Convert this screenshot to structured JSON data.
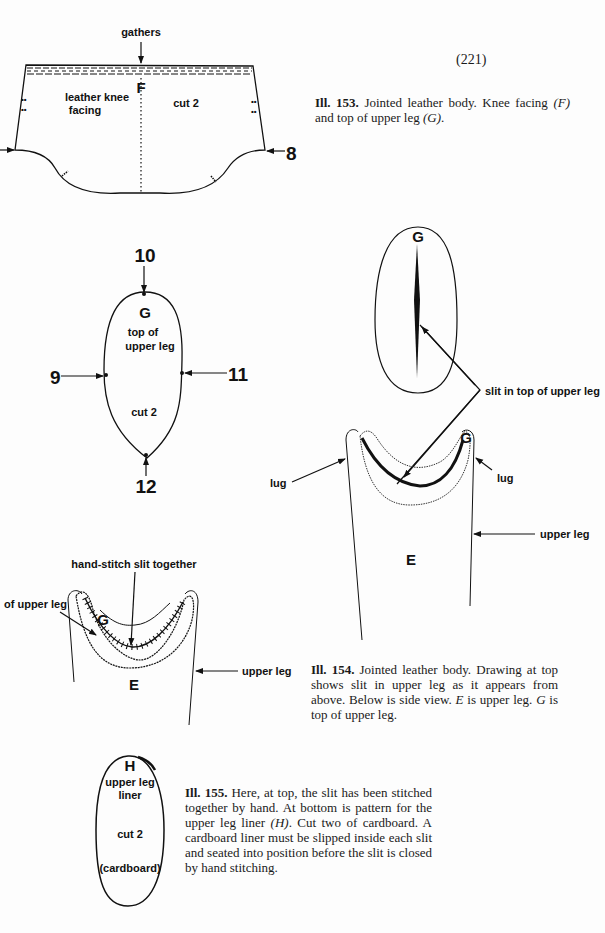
{
  "page_number": "(221)",
  "figures": {
    "ill153": {
      "labels": {
        "gathers": "gathers",
        "piece_letter": "F",
        "piece_name_line1": "leather knee",
        "piece_name_line2": "facing",
        "cut": "cut 2",
        "marker_right": "8"
      },
      "caption": {
        "number": "Ill. 153.",
        "text": " Jointed leather body. Knee facing ",
        "ref1": "(F)",
        "text2": " and top of upper leg ",
        "ref2": "(G)",
        "text3": "."
      }
    },
    "pattern_g": {
      "letter": "G",
      "name_line1": "top of",
      "name_line2": "upper leg",
      "cut": "cut 2",
      "markers": {
        "top": "10",
        "left": "9",
        "right": "11",
        "bottom": "12"
      }
    },
    "ill154": {
      "top_view_letter": "G",
      "side_view_letter_g": "G",
      "side_view_letter_e": "E",
      "slit_label": "slit in top of upper leg",
      "lug_left": "lug",
      "lug_right": "lug",
      "upper_leg_label": "upper leg",
      "caption": {
        "number": "Ill. 154.",
        "text": " Jointed leather body. Drawing at top shows slit in upper leg as it appears from above. Below is side view. ",
        "ref_e": "E",
        "text2": " is upper leg. ",
        "ref_g": "G",
        "text3": " is top of upper leg."
      }
    },
    "ill155": {
      "stitch_label": "hand-stitch slit together",
      "partial_label": "of upper leg",
      "letter_g": "G",
      "letter_e": "E",
      "upper_leg_label": "upper leg",
      "liner": {
        "letter": "H",
        "name_line1": "upper leg",
        "name_line2": "liner",
        "cut": "cut 2",
        "material": "(cardboard)"
      },
      "caption": {
        "number": "Ill. 155.",
        "text": " Here, at top, the slit has been stitched together by hand. At bottom is pattern for the upper leg liner ",
        "ref_h": "(H)",
        "text2": ". Cut two of cardboard. A cardboard liner must be slipped inside each slit and seated into position before the slit is closed by hand stitching."
      }
    }
  }
}
